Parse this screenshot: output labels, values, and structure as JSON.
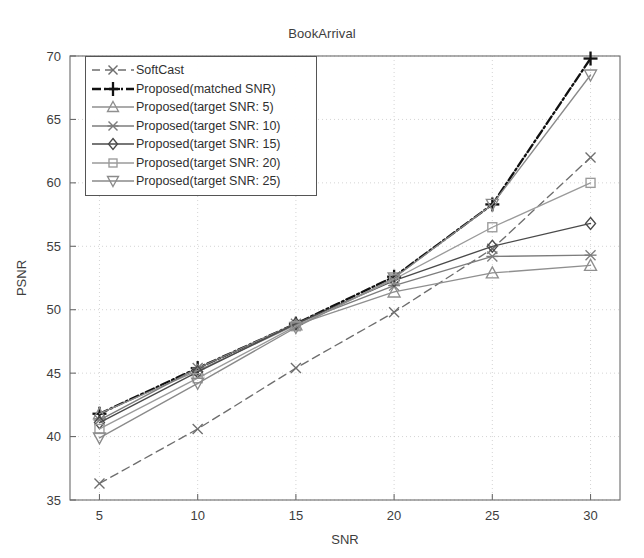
{
  "chart_data": {
    "type": "line",
    "title": "BookArrival",
    "xlabel": "SNR",
    "ylabel": "PSNR",
    "x": [
      5,
      10,
      15,
      20,
      25,
      30
    ],
    "xlim": [
      3.5,
      31.5
    ],
    "ylim": [
      35,
      70
    ],
    "xticks": [
      "5",
      "10",
      "15",
      "20",
      "25",
      "30"
    ],
    "yticks": [
      "35",
      "40",
      "45",
      "50",
      "55",
      "60",
      "65",
      "70"
    ],
    "grid": true,
    "legend_position": "upper left",
    "series": [
      {
        "name": "SoftCast",
        "marker": "x",
        "linestyle": "dashed",
        "color": "#6e6e6e",
        "values": [
          36.3,
          40.6,
          45.4,
          49.8,
          54.8,
          62.0
        ]
      },
      {
        "name": "Proposed(matched SNR)",
        "marker": "plus",
        "linestyle": "dashdot",
        "color": "#111111",
        "values": [
          41.8,
          45.4,
          48.9,
          52.6,
          58.3,
          69.8
        ]
      },
      {
        "name": "Proposed(target SNR: 5)",
        "marker": "triangle-up",
        "linestyle": "solid",
        "color": "#8f8f8f",
        "values": [
          41.8,
          45.2,
          48.8,
          51.4,
          52.9,
          53.5
        ]
      },
      {
        "name": "Proposed(target SNR: 10)",
        "marker": "star",
        "linestyle": "solid",
        "color": "#7d7d7d",
        "values": [
          41.3,
          45.4,
          48.9,
          51.9,
          54.2,
          54.3
        ]
      },
      {
        "name": "Proposed(target SNR: 15)",
        "marker": "diamond",
        "linestyle": "solid",
        "color": "#4a4a4a",
        "values": [
          41.1,
          45.1,
          48.9,
          52.3,
          55.0,
          56.8
        ]
      },
      {
        "name": "Proposed(target SNR: 20)",
        "marker": "square",
        "linestyle": "solid",
        "color": "#9a9a9a",
        "values": [
          40.6,
          44.6,
          48.7,
          52.4,
          56.5,
          60.0
        ]
      },
      {
        "name": "Proposed(target SNR: 25)",
        "marker": "triangle-down",
        "linestyle": "solid",
        "color": "#8a8a8a",
        "values": [
          39.9,
          44.2,
          48.6,
          52.5,
          58.3,
          68.5
        ]
      }
    ]
  },
  "legend": {
    "entries": [
      {
        "label": "SoftCast"
      },
      {
        "label": "Proposed(matched SNR)"
      },
      {
        "label": "Proposed(target SNR: 5)"
      },
      {
        "label": "Proposed(target SNR: 10)"
      },
      {
        "label": "Proposed(target SNR: 15)"
      },
      {
        "label": "Proposed(target SNR: 20)"
      },
      {
        "label": "Proposed(target SNR: 25)"
      }
    ]
  }
}
